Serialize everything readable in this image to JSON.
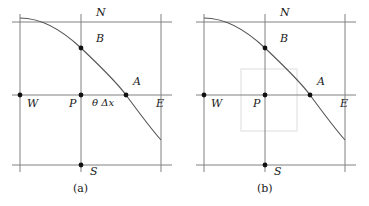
{
  "figure": {
    "type": "diagram",
    "background_color": "#ffffff",
    "line_color": "#808080",
    "curve_color": "#555555",
    "node_color": "#111111",
    "box_fill": "#ffffff",
    "box_stroke": "#e3e3e3",
    "width": 369,
    "height": 206
  },
  "panels": [
    {
      "id": "a",
      "caption": "(a)",
      "caption_x": 83,
      "caption_y": 184,
      "has_control_volume_box": false,
      "nodes": [
        {
          "key": "N",
          "label": "N",
          "label_x": 96,
          "label_y": 12,
          "dot": false,
          "dot_x": 81,
          "dot_y": 22
        },
        {
          "key": "B",
          "label": "B",
          "label_x": 96,
          "label_y": 38,
          "dot": true,
          "dot_x": 81,
          "dot_y": 48
        },
        {
          "key": "A",
          "label": "A",
          "label_x": 133,
          "label_y": 81,
          "dot": true,
          "dot_x": 126,
          "dot_y": 95
        },
        {
          "key": "W",
          "label": "W",
          "label_x": 27,
          "label_y": 99,
          "dot": true,
          "dot_x": 20,
          "dot_y": 95
        },
        {
          "key": "P",
          "label": "P",
          "label_x": 71,
          "label_y": 99,
          "dot": true,
          "dot_x": 81,
          "dot_y": 95
        },
        {
          "key": "E",
          "label": "E",
          "label_x": 156,
          "label_y": 99,
          "dot": false,
          "dot_x": 161,
          "dot_y": 95
        },
        {
          "key": "S",
          "label": "S",
          "label_x": 90,
          "label_y": 166,
          "dot": true,
          "dot_x": 81,
          "dot_y": 165
        }
      ],
      "annotations": [
        {
          "key": "theta-delta-x",
          "text": "θ Δx",
          "x": 93,
          "y": 99
        }
      ]
    },
    {
      "id": "b",
      "caption": "(b)",
      "caption_x": 83,
      "caption_y": 184,
      "has_control_volume_box": true,
      "control_volume_box": {
        "x": 57,
        "y": 69,
        "width": 56,
        "height": 62
      },
      "nodes": [
        {
          "key": "N",
          "label": "N",
          "label_x": 96,
          "label_y": 12,
          "dot": false,
          "dot_x": 81,
          "dot_y": 22
        },
        {
          "key": "B",
          "label": "B",
          "label_x": 96,
          "label_y": 38,
          "dot": true,
          "dot_x": 81,
          "dot_y": 48
        },
        {
          "key": "A",
          "label": "A",
          "label_x": 133,
          "label_y": 81,
          "dot": true,
          "dot_x": 126,
          "dot_y": 95
        },
        {
          "key": "W",
          "label": "W",
          "label_x": 27,
          "label_y": 99,
          "dot": true,
          "dot_x": 20,
          "dot_y": 95
        },
        {
          "key": "P",
          "label": "P",
          "label_x": 71,
          "label_y": 99,
          "dot": true,
          "dot_x": 81,
          "dot_y": 95
        },
        {
          "key": "E",
          "label": "E",
          "label_x": 156,
          "label_y": 99,
          "dot": false,
          "dot_x": 161,
          "dot_y": 95
        },
        {
          "key": "S",
          "label": "S",
          "label_x": 90,
          "label_y": 166,
          "dot": true,
          "dot_x": 81,
          "dot_y": 165
        }
      ],
      "annotations": []
    }
  ],
  "grid": {
    "horizontal_lines_y": [
      22,
      95,
      165
    ],
    "vertical_lines_x": [
      20,
      81,
      161
    ],
    "h_line_extent": [
      12,
      172
    ],
    "v_line_extent": [
      14,
      172
    ]
  },
  "curve": {
    "description": "characteristic curve through B, P-column, A",
    "start": [
      20,
      18
    ],
    "end": [
      161,
      140
    ],
    "path": "M 20 18 C 44 18, 64 32, 81 48 C 100 66, 118 84, 126 95 C 140 114, 152 130, 161 140"
  }
}
